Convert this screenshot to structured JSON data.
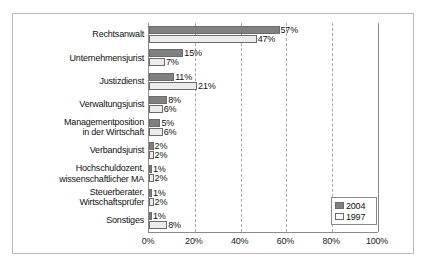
{
  "chart_data": {
    "type": "bar",
    "orientation": "horizontal",
    "title": "",
    "xlabel": "",
    "ylabel": "",
    "xlim": [
      0,
      100
    ],
    "grid": true,
    "legend_position": "bottom-right",
    "tick_labels": [
      "0%",
      "20%",
      "40%",
      "60%",
      "80%",
      "100%"
    ],
    "tick_values": [
      0,
      20,
      40,
      60,
      80,
      100
    ],
    "categories": [
      "Rechtsanwalt",
      "Unternehmensjurist",
      "Justizdienst",
      "Verwaltungsjurist",
      "Managementposition\nin der Wirtschaft",
      "Verbandsjurist",
      "Hochschuldozent,\nwissenschaftlicher MA",
      "Steuerberater,\nWirtschaftsprüfer",
      "Sonstiges"
    ],
    "category_lines": [
      [
        "Rechtsanwalt"
      ],
      [
        "Unternehmensjurist"
      ],
      [
        "Justizdienst"
      ],
      [
        "Verwaltungsjurist"
      ],
      [
        "Managementposition",
        "in der Wirtschaft"
      ],
      [
        "Verbandsjurist"
      ],
      [
        "Hochschuldozent,",
        "wissenschaftlicher MA"
      ],
      [
        "Steuerberater,",
        "Wirtschaftsprüfer"
      ],
      [
        "Sonstiges"
      ]
    ],
    "series": [
      {
        "name": "2004",
        "color": "#808080",
        "values": [
          57,
          15,
          11,
          8,
          5,
          2,
          1,
          1,
          1
        ],
        "labels": [
          "57%",
          "15%",
          "11%",
          "8%",
          "5%",
          "2%",
          "1%",
          "1%",
          "1%"
        ]
      },
      {
        "name": "1997",
        "color": "#ececec",
        "values": [
          47,
          7,
          21,
          6,
          6,
          2,
          2,
          2,
          8
        ],
        "labels": [
          "47%",
          "7%",
          "21%",
          "6%",
          "6%",
          "2%",
          "2%",
          "2%",
          "8%"
        ]
      }
    ]
  },
  "legend": {
    "entries": [
      {
        "label": "2004"
      },
      {
        "label": "1997"
      }
    ]
  }
}
